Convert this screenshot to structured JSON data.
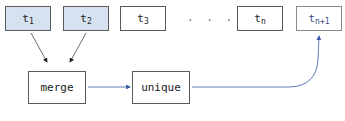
{
  "diagram": {
    "inputs": [
      {
        "id": "t1",
        "base": "t",
        "sub": "1",
        "highlighted": true
      },
      {
        "id": "t2",
        "base": "t",
        "sub": "2",
        "highlighted": true
      },
      {
        "id": "t3",
        "base": "t",
        "sub": "3",
        "highlighted": false
      },
      {
        "id": "tn",
        "base": "t",
        "sub": "n",
        "highlighted": false
      }
    ],
    "ellipsis": ". . .",
    "output": {
      "id": "tn+1",
      "base": "t",
      "sub": "n+1"
    },
    "operations": [
      {
        "id": "merge",
        "label": "merge"
      },
      {
        "id": "unique",
        "label": "unique"
      }
    ],
    "edges": [
      {
        "from": "t1",
        "to": "merge",
        "color": "#333333"
      },
      {
        "from": "t2",
        "to": "merge",
        "color": "#333333"
      },
      {
        "from": "merge",
        "to": "unique",
        "color": "#3a5aa8"
      },
      {
        "from": "unique",
        "to": "tn+1",
        "color": "#3a5aa8"
      }
    ],
    "colors": {
      "highlight_fill": "#d6e2f0",
      "flow_arrow": "#3a5aa8",
      "border": "#5a5a5a"
    }
  }
}
